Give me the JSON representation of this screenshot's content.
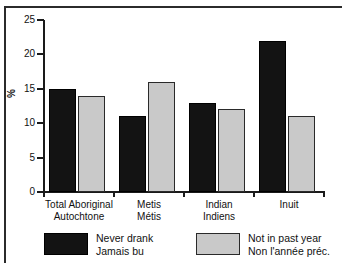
{
  "chart_data": {
    "type": "bar",
    "title": "",
    "xlabel": "",
    "ylabel": "%",
    "ylim": [
      0,
      25
    ],
    "yticks": [
      0,
      5,
      10,
      15,
      20,
      25
    ],
    "grid": false,
    "legend_position": "bottom",
    "categories": [
      "Total Aboriginal\nAutochtone",
      "Metis\nMétis",
      "Indian\nIndiens",
      "Inuit"
    ],
    "category_lines": [
      {
        "line1": "Total Aboriginal",
        "line2": "Autochtone"
      },
      {
        "line1": "Metis",
        "line2": "Métis"
      },
      {
        "line1": "Indian",
        "line2": "Indiens"
      },
      {
        "line1": "Inuit",
        "line2": ""
      }
    ],
    "series": [
      {
        "name": "Never drank / Jamais bu",
        "label_line1": "Never drank",
        "label_line2": "Jamais bu",
        "color": "#131313",
        "values": [
          15,
          11,
          13,
          22
        ]
      },
      {
        "name": "Not in past year / Non l'année préc.",
        "label_line1": "Not in past year",
        "label_line2": "Non l'année préc.",
        "color": "#c9c9c9",
        "values": [
          14,
          16,
          12,
          11
        ]
      }
    ]
  },
  "axis": {
    "y_tick_labels": [
      "0",
      "5",
      "10",
      "15",
      "20",
      "25"
    ],
    "y_axis_title": "%"
  }
}
